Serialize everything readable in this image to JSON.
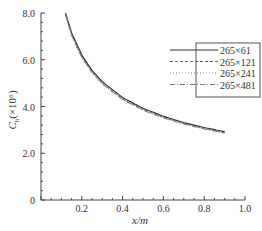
{
  "chart_data": {
    "type": "line",
    "title": "",
    "xlabel": "x/m",
    "ylabel": "C_h (×10^6)",
    "xlim": [
      0,
      1.0
    ],
    "ylim": [
      0,
      8.0
    ],
    "x_ticks": [
      "0.2",
      "0.4",
      "0.6",
      "0.8",
      "1.0"
    ],
    "y_ticks": [
      "0",
      "2.0",
      "4.0",
      "6.0",
      "8.0"
    ],
    "grid": false,
    "legend_position": "upper right",
    "x": [
      0.12,
      0.15,
      0.2,
      0.25,
      0.3,
      0.4,
      0.5,
      0.6,
      0.7,
      0.8,
      0.9
    ],
    "series": [
      {
        "name": "265×61",
        "style": "solid",
        "values": [
          8.0,
          7.15,
          6.2,
          5.54,
          5.06,
          4.38,
          3.92,
          3.58,
          3.31,
          3.1,
          2.92
        ]
      },
      {
        "name": "265×121",
        "style": "dashed",
        "values": [
          7.95,
          7.08,
          6.12,
          5.47,
          4.99,
          4.32,
          3.87,
          3.53,
          3.27,
          3.06,
          2.88
        ]
      },
      {
        "name": "265×241",
        "style": "dotted",
        "values": [
          7.93,
          7.05,
          6.1,
          5.45,
          4.97,
          4.3,
          3.85,
          3.52,
          3.26,
          3.05,
          2.87
        ]
      },
      {
        "name": "265×481",
        "style": "dashdot",
        "values": [
          7.92,
          7.04,
          6.09,
          5.44,
          4.96,
          4.29,
          3.84,
          3.51,
          3.25,
          3.04,
          2.86
        ]
      }
    ]
  },
  "labels": {
    "xlabel": "x/m",
    "ylabel_main": "C",
    "ylabel_sub": "h",
    "ylabel_rest": "(×10⁶)",
    "legend": [
      "265×61",
      "265×121",
      "265×241",
      "265×481"
    ],
    "x_ticks": [
      "0.2",
      "0.4",
      "0.6",
      "0.8",
      "1.0"
    ],
    "y_ticks": [
      "0",
      "2.0",
      "4.0",
      "6.0",
      "8.0"
    ]
  }
}
